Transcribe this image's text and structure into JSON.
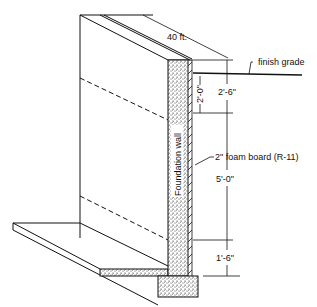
{
  "diagram": {
    "type": "foundation wall insulation section",
    "labels": {
      "length": "40 ft.",
      "finish_grade": "finish grade",
      "wall": "Foundation wall",
      "foam": "2\" foam board (R-11)"
    },
    "dimensions": {
      "above_grade_total": "2'-6\"",
      "below_grade_upper": "2'-0\"",
      "middle": "5'-0\"",
      "bottom": "1'-6\""
    },
    "colors": {
      "line": "#111111",
      "background": "#ffffff"
    }
  }
}
